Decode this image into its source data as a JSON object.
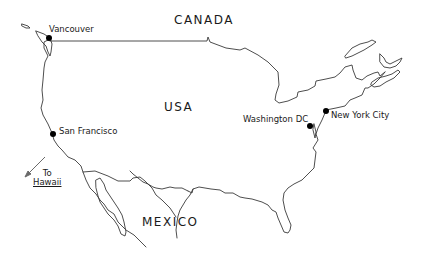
{
  "map": {
    "countries": {
      "canada": "CANADA",
      "usa": "USA",
      "mexico": "MEXICO"
    },
    "cities": [
      {
        "name": "Vancouver"
      },
      {
        "name": "San Francisco"
      },
      {
        "name": "Washington DC"
      },
      {
        "name": "New York City"
      }
    ],
    "annotation": {
      "line1": "To",
      "line2": "Hawaii"
    },
    "colors": {
      "line": "#3a3a3a",
      "marker": "#000000",
      "text": "#1a1a1a"
    }
  }
}
